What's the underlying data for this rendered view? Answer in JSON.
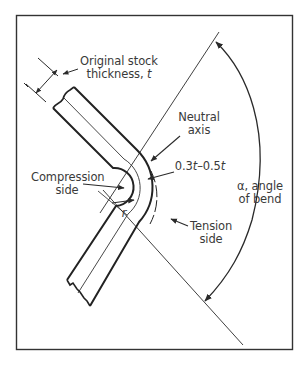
{
  "diagram": {
    "labels": {
      "stock_thickness_line1": "Original stock",
      "stock_thickness_line2_prefix": "thickness, ",
      "stock_thickness_var": "t",
      "neutral_axis_line1": "Neutral",
      "neutral_axis_line2": "axis",
      "offset_range": "0.3t–0.5t",
      "offset_a": "0.3",
      "offset_b": "0.5",
      "offset_var": "t",
      "offset_sep": "–",
      "compression_line1": "Compression",
      "compression_line2": "side",
      "radius_var": "r",
      "angle_line1_symbol": "α",
      "angle_line1_rest": ", angle",
      "angle_line2": "of bend",
      "tension_line1": "Tension",
      "tension_line2": "side"
    },
    "colors": {
      "line": "#2a2a2a",
      "text": "#3a3a3a",
      "frame": "#333333",
      "background": "#ffffff"
    }
  }
}
